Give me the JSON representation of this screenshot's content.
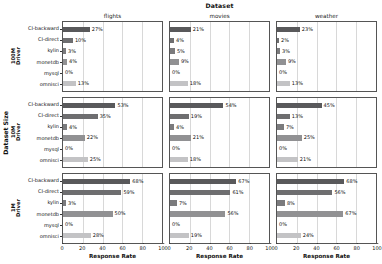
{
  "chart_data": {
    "type": "bar",
    "title": "Dataset",
    "xlabel": "Response Rate",
    "ylabel": "Dataset Size",
    "orientation": "horizontal",
    "grid": true,
    "legend": "none",
    "xlim": [
      0,
      100
    ],
    "xticks": [
      0,
      20,
      40,
      60,
      80,
      100
    ],
    "categories": [
      "CI-backward",
      "CI-direct",
      "kylin",
      "monetdb",
      "mysql",
      "omnisci"
    ],
    "col_facets": [
      "flights",
      "movies",
      "weather"
    ],
    "row_facets": [
      "100M\nDriver",
      "10M\nDriver",
      "1M\nDriver"
    ],
    "value_suffix": "%",
    "panels": [
      {
        "row": "100M\nDriver",
        "col": "flights",
        "values": [
          27,
          10,
          3,
          4,
          0,
          13
        ],
        "labels": [
          "27%",
          "10%",
          "3%",
          "4%",
          "0%",
          "13%"
        ]
      },
      {
        "row": "100M\nDriver",
        "col": "movies",
        "values": [
          21,
          4,
          5,
          9,
          0,
          18
        ],
        "labels": [
          "21%",
          "4%",
          "5%",
          "9%",
          "0%",
          "18%"
        ]
      },
      {
        "row": "100M\nDriver",
        "col": "weather",
        "values": [
          23,
          2,
          3,
          9,
          0,
          13
        ],
        "labels": [
          "23%",
          "2%",
          "3%",
          "9%",
          "0%",
          "13%"
        ]
      },
      {
        "row": "10M\nDriver",
        "col": "flights",
        "values": [
          53,
          35,
          4,
          22,
          0,
          25
        ],
        "labels": [
          "53%",
          "35%",
          "4%",
          "22%",
          "0%",
          "25%"
        ]
      },
      {
        "row": "10M\nDriver",
        "col": "movies",
        "values": [
          54,
          19,
          4,
          21,
          0,
          18
        ],
        "labels": [
          "54%",
          "19%",
          "4%",
          "21%",
          "0%",
          "18%"
        ]
      },
      {
        "row": "10M\nDriver",
        "col": "weather",
        "values": [
          45,
          13,
          7,
          25,
          0,
          21
        ],
        "labels": [
          "45%",
          "13%",
          "7%",
          "25%",
          "0%",
          "21%"
        ]
      },
      {
        "row": "1M\nDriver",
        "col": "flights",
        "values": [
          68,
          59,
          3,
          50,
          0,
          28
        ],
        "labels": [
          "68%",
          "59%",
          "3%",
          "50%",
          "0%",
          "28%"
        ]
      },
      {
        "row": "1M\nDriver",
        "col": "movies",
        "values": [
          67,
          61,
          7,
          56,
          0,
          19
        ],
        "labels": [
          "67%",
          "61%",
          "7%",
          "56%",
          "0%",
          "19%"
        ]
      },
      {
        "row": "1M\nDriver",
        "col": "weather",
        "values": [
          68,
          56,
          8,
          67,
          0,
          24
        ],
        "labels": [
          "68%",
          "56%",
          "8%",
          "67%",
          "0%",
          "24%"
        ]
      }
    ],
    "bar_colors": [
      "#59595b",
      "#6e6e70",
      "#7b7b7d",
      "#919193",
      "#a8a8aa",
      "#c3c3c5"
    ],
    "axis_color": "#555555",
    "grid_color": "#d8d8d8",
    "background": "#ffffff"
  }
}
